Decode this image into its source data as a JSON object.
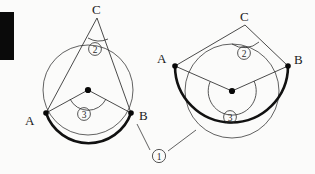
{
  "figure": {
    "background_color": "#fbfbfa",
    "ink_color": "#1a1a1a",
    "bold_arc_color": "#111111"
  },
  "callout": {
    "id": "1",
    "label": "①",
    "name": "arc-ab-callout",
    "description": "bold arc AB, pointed to by two leader lines"
  },
  "left_circle": {
    "name": "inscribed-angle-acute-case",
    "center": {
      "x": 88,
      "y": 90,
      "label": ""
    },
    "radius": 45,
    "points": [
      {
        "id": "A",
        "label": "A",
        "x": 46,
        "y": 113
      },
      {
        "id": "B",
        "label": "B",
        "x": 131,
        "y": 113
      },
      {
        "id": "C",
        "label": "C",
        "x": 97,
        "y": 18
      }
    ],
    "angles": [
      {
        "id": "2",
        "label": "②",
        "vertex": "C",
        "kind": "inscribed",
        "x": 95,
        "y": 52
      },
      {
        "id": "3",
        "label": "③",
        "vertex": "O",
        "kind": "central",
        "x": 84,
        "y": 117
      }
    ],
    "bold_arc": "minor arc from A to B passing below the center"
  },
  "right_circle": {
    "name": "inscribed-angle-reflex-case",
    "center": {
      "x": 232,
      "y": 91,
      "label": ""
    },
    "radius": 47,
    "points": [
      {
        "id": "A",
        "label": "A",
        "x": 175,
        "y": 66
      },
      {
        "id": "B",
        "label": "B",
        "x": 288,
        "y": 66
      },
      {
        "id": "C",
        "label": "C",
        "x": 245,
        "y": 25
      }
    ],
    "angles": [
      {
        "id": "2",
        "label": "②",
        "vertex": "C",
        "kind": "inscribed",
        "x": 244,
        "y": 56
      },
      {
        "id": "3",
        "label": "③",
        "vertex": "O",
        "kind": "central-reflex",
        "x": 230,
        "y": 120
      }
    ],
    "bold_arc": "major arc from A around the bottom to B"
  }
}
